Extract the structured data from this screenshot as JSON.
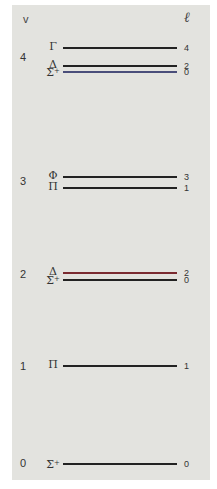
{
  "headers": {
    "v": "v",
    "l": "ℓ"
  },
  "colors": {
    "background": "#e3e3df",
    "line_default": "#222222",
    "line_sigma_v4": "#4a4e7a",
    "line_delta_v2": "#7a2a30"
  },
  "levels": [
    {
      "v": "4",
      "v_y": 57,
      "states": [
        {
          "symbol": "Γ",
          "sup": "",
          "l": "4",
          "y": 48,
          "color": "#222222"
        },
        {
          "symbol": "Δ",
          "sup": "",
          "l": "2",
          "y": 66,
          "color": "#222222"
        },
        {
          "symbol": "Σ",
          "sup": "+",
          "l": "0",
          "y": 72,
          "color": "#4a4e7a"
        }
      ]
    },
    {
      "v": "3",
      "v_y": 181,
      "states": [
        {
          "symbol": "Φ",
          "sup": "",
          "l": "3",
          "y": 177,
          "color": "#222222"
        },
        {
          "symbol": "Π",
          "sup": "",
          "l": "1",
          "y": 188,
          "color": "#222222"
        }
      ]
    },
    {
      "v": "2",
      "v_y": 274,
      "states": [
        {
          "symbol": "Δ",
          "sup": "",
          "l": "2",
          "y": 273,
          "color": "#7a2a30"
        },
        {
          "symbol": "Σ",
          "sup": "+",
          "l": "0",
          "y": 280,
          "color": "#222222"
        }
      ]
    },
    {
      "v": "1",
      "v_y": 366,
      "states": [
        {
          "symbol": "Π",
          "sup": "",
          "l": "1",
          "y": 366,
          "color": "#222222"
        }
      ]
    },
    {
      "v": "0",
      "v_y": 463,
      "states": [
        {
          "symbol": "Σ",
          "sup": "+",
          "l": "0",
          "y": 464,
          "color": "#222222"
        }
      ]
    }
  ]
}
